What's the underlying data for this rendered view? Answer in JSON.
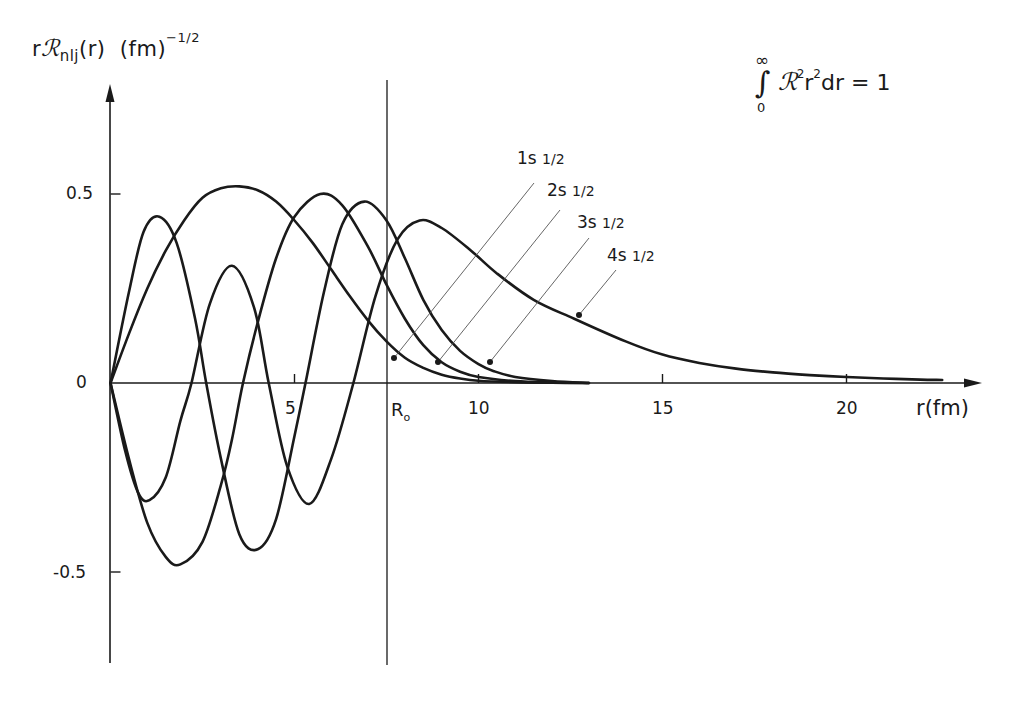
{
  "chart_data": {
    "type": "line",
    "title": "",
    "ylabel": "rR_nlj(r) (fm)^-1/2",
    "xlabel": "r(fm)",
    "xlim": [
      0,
      23.5
    ],
    "ylim": [
      -0.75,
      0.8
    ],
    "grid": false,
    "legend": "inline labels with leader lines",
    "x_ticks": [
      5,
      10,
      15,
      20
    ],
    "x_tick_labels": [
      "5",
      "10",
      "15",
      "20"
    ],
    "y_ticks": [
      -0.5,
      0,
      0.5
    ],
    "y_tick_labels": [
      "-0.5",
      "0",
      "0.5"
    ],
    "annotations": [
      {
        "text": "R₀",
        "x": 7.5,
        "type": "vertical-line"
      },
      {
        "text": "∫₀^∞ R² r² dr = 1",
        "type": "normalization-note"
      }
    ],
    "series": [
      {
        "name": "1s 1/2",
        "x": [
          0,
          0.5,
          1,
          1.5,
          2,
          2.5,
          3,
          3.5,
          4,
          4.5,
          5,
          5.5,
          6,
          6.5,
          7,
          7.5,
          8,
          8.5,
          9,
          9.5,
          10,
          11,
          12,
          13
        ],
        "y": [
          0,
          0.13,
          0.25,
          0.35,
          0.43,
          0.49,
          0.515,
          0.52,
          0.51,
          0.48,
          0.43,
          0.37,
          0.3,
          0.23,
          0.165,
          0.11,
          0.067,
          0.04,
          0.022,
          0.012,
          0.006,
          0.002,
          0.0005,
          0
        ]
      },
      {
        "name": "2s 1/2",
        "x": [
          0,
          0.5,
          1,
          1.5,
          1.9,
          2.5,
          3,
          3.3,
          3.6,
          4,
          4.5,
          5,
          5.7,
          6.3,
          7,
          7.5,
          8,
          8.5,
          9,
          9.5,
          10,
          11,
          12,
          13
        ],
        "y": [
          0,
          -0.2,
          -0.37,
          -0.46,
          -0.48,
          -0.42,
          -0.27,
          -0.15,
          0,
          0.16,
          0.33,
          0.44,
          0.5,
          0.47,
          0.36,
          0.26,
          0.17,
          0.1,
          0.055,
          0.03,
          0.016,
          0.005,
          0.0015,
          0
        ]
      },
      {
        "name": "3s 1/2",
        "x": [
          0,
          0.5,
          0.9,
          1.33,
          1.8,
          2.3,
          2.6,
          3.0,
          3.5,
          4.0,
          4.5,
          5.0,
          5.3,
          5.8,
          6.3,
          6.9,
          7.5,
          8.0,
          8.5,
          9,
          9.5,
          10,
          10.4,
          11,
          12,
          13
        ],
        "y": [
          0,
          0.24,
          0.4,
          0.44,
          0.37,
          0.17,
          0,
          -0.2,
          -0.4,
          -0.44,
          -0.36,
          -0.14,
          0,
          0.24,
          0.42,
          0.48,
          0.43,
          0.33,
          0.22,
          0.14,
          0.085,
          0.05,
          0.032,
          0.016,
          0.005,
          0
        ]
      },
      {
        "name": "4s 1/2",
        "x": [
          0,
          0.4,
          0.75,
          1.06,
          1.5,
          1.9,
          2.2,
          2.7,
          3.3,
          3.9,
          4.3,
          4.8,
          5.4,
          6.0,
          6.6,
          7.2,
          7.8,
          8.4,
          9.0,
          9.8,
          10.5,
          11.5,
          12.6,
          14,
          15,
          16,
          17,
          18,
          19,
          20,
          21,
          22,
          22.6
        ],
        "y": [
          0,
          -0.18,
          -0.29,
          -0.31,
          -0.25,
          -0.1,
          0,
          0.21,
          0.31,
          0.2,
          0,
          -0.22,
          -0.32,
          -0.2,
          0,
          0.23,
          0.38,
          0.43,
          0.41,
          0.35,
          0.29,
          0.22,
          0.17,
          0.11,
          0.075,
          0.053,
          0.038,
          0.028,
          0.021,
          0.016,
          0.012,
          0.009,
          0.008
        ]
      }
    ],
    "marked_points": [
      {
        "series": "1s 1/2",
        "x": 7.7,
        "y": 0.07
      },
      {
        "series": "2s 1/2",
        "x": 8.9,
        "y": 0.055
      },
      {
        "series": "3s 1/2",
        "x": 10.3,
        "y": 0.055
      },
      {
        "series": "4s 1/2",
        "x": 12.7,
        "y": 0.18
      }
    ]
  },
  "labels": {
    "ylabel_prefix": "r",
    "ylabel_script": "ℛ",
    "ylabel_sub": "nlj",
    "ylabel_mid": "(r)  (fm)",
    "ylabel_sup": "−1/2",
    "xtitle": "r(fm)",
    "y_tick_pos": "0.5",
    "y_tick_zero": "0",
    "y_tick_neg": "-0.5",
    "x_tick_5": "5",
    "x_tick_10": "10",
    "x_tick_15": "15",
    "x_tick_20": "20",
    "r0_main": "R",
    "r0_sub": "o",
    "norm_int": "∫",
    "norm_inf": "∞",
    "norm_zero": "0",
    "norm_script": "ℛ",
    "norm_sup1": "2",
    "norm_r": "r",
    "norm_sup2": "2",
    "norm_rest": "dr = 1",
    "states": [
      {
        "main": "1s ",
        "frac": "1/2"
      },
      {
        "main": "2s ",
        "frac": "1/2"
      },
      {
        "main": "3s ",
        "frac": "1/2"
      },
      {
        "main": "4s ",
        "frac": "1/2"
      }
    ]
  },
  "colors": {
    "ink": "#1a1a1a",
    "leader": "#555555",
    "background": "#ffffff"
  }
}
